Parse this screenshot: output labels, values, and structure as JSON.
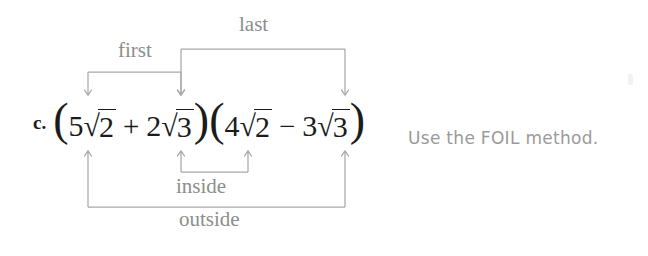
{
  "figure": {
    "item_letter": "c.",
    "note": "Use the FOIL method.",
    "expression": {
      "full_text": "(5√2 + 2√3)(4√2 − 3√3)",
      "factor1": {
        "open_paren": "(",
        "term1": {
          "coefficient": "5",
          "radical": "√",
          "radicand": "2"
        },
        "operator": "+",
        "term2": {
          "coefficient": "2",
          "radical": "√",
          "radicand": "3"
        },
        "close_paren": ")"
      },
      "factor2": {
        "open_paren": "(",
        "term1": {
          "coefficient": "4",
          "radical": "√",
          "radicand": "2"
        },
        "operator": "−",
        "term2": {
          "coefficient": "3",
          "radical": "√",
          "radicand": "3"
        },
        "close_paren": ")"
      }
    },
    "labels": {
      "first": "first",
      "last": "last",
      "inside": "inside",
      "outside": "outside"
    },
    "colors": {
      "connector_line": "#a8a8a8",
      "label_text": "#8d8d8d",
      "expression_text": "#1b1b1b",
      "note_text": "#9a9a9a",
      "background": "#ffffff"
    },
    "connectors": [
      {
        "name": "first",
        "side": "top",
        "from_x": 88,
        "to_x": 181,
        "bar_y": 72,
        "arrow_y": 100
      },
      {
        "name": "last",
        "side": "top",
        "from_x": 181,
        "to_x": 345,
        "bar_y": 49,
        "arrow_y": 100
      },
      {
        "name": "inside",
        "side": "bottom",
        "from_x": 181,
        "to_x": 248,
        "bar_y": 172,
        "arrow_y": 146
      },
      {
        "name": "outside",
        "side": "bottom",
        "from_x": 88,
        "to_x": 345,
        "bar_y": 207,
        "arrow_y": 146
      }
    ],
    "arrow_columns": [
      88,
      181,
      248,
      345
    ]
  }
}
